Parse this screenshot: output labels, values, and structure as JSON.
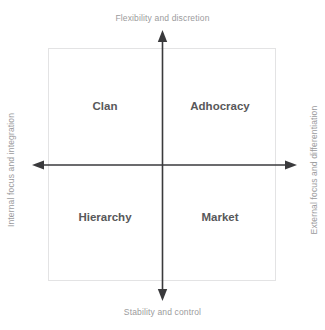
{
  "diagram": {
    "axes": {
      "top_label": "Flexibility and discretion",
      "bottom_label": "Stability and control",
      "left_label": "Internal focus and integration",
      "right_label": "External focus and differentiation"
    },
    "quadrants": [
      {
        "key": "clan",
        "label": "Clan",
        "position": "top-left"
      },
      {
        "key": "adhocracy",
        "label": "Adhocracy",
        "position": "top-right"
      },
      {
        "key": "hierarchy",
        "label": "Hierarchy",
        "position": "bottom-left"
      },
      {
        "key": "market",
        "label": "Market",
        "position": "bottom-right"
      }
    ],
    "colors": {
      "background": "#ffffff",
      "axis_line": "#3a3a3c",
      "axis_label_text": "#9b9b9d",
      "quadrant_label_text": "#58585a",
      "frame_border": "#e3e3e4"
    }
  }
}
